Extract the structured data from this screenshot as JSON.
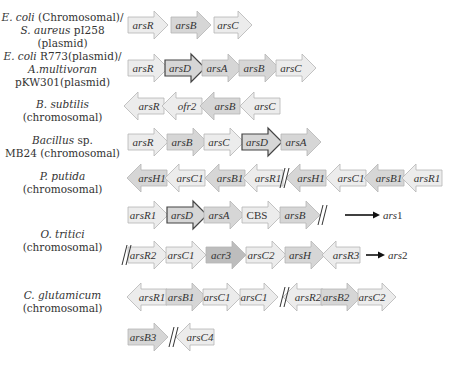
{
  "colors": {
    "light": "#ececec",
    "mid": "#d6d6d6",
    "dark": "#bdbdbd",
    "stroke_light": "#b5b5b5",
    "stroke_dark": "#444444"
  },
  "organisms": [
    {
      "id": "ecoli-saureus",
      "lines": [
        [
          "E. coli",
          "italic"
        ],
        [
          " (Chromosomal)/",
          ""
        ],
        [
          "S. aureus",
          "italic"
        ],
        [
          " pI258 (plasmid)",
          ""
        ]
      ],
      "text": "E. coli (Chromosomal)/ S. aureus pI258 (plasmid)"
    },
    {
      "id": "ecoli-r773",
      "text": "E. coli R773(plasmid)/ A.multivoran pKW301(plasmid)"
    },
    {
      "id": "bsubtilis",
      "text": "B. subtilis (chromosomal)"
    },
    {
      "id": "bacillus-mb24",
      "text": "Bacillus sp. MB24 (chromosomal)"
    },
    {
      "id": "pputida",
      "text": "P. putida (chromosomal)"
    },
    {
      "id": "otritici",
      "text": "O. tritici (chromosomal)"
    },
    {
      "id": "cglutamicum",
      "text": "C. glutamicum (chromosomal)"
    }
  ],
  "labels": {
    "l1a": "E. coli",
    "l1b": " (Chromosomal)/",
    "l1c": "S. aureus",
    "l1d": " pI258 (plasmid)",
    "l2a": "E. coli",
    "l2b": " R773(plasmid)/",
    "l2c": "A.multivoran",
    "l2d": "pKW301(plasmid)",
    "l3a": "B. subtilis",
    "l3b": "(chromosomal)",
    "l4a": "Bacillus",
    "l4b": " sp.",
    "l4c": "MB24 (chromosomal)",
    "l5a": "P. putida",
    "l5b": "(chromosomal)",
    "l6a": "O. tritici",
    "l6b": "(chromosomal)",
    "l7a": "C. glutamicum",
    "l7b": "(chromosomal)"
  },
  "gene_rows": [
    {
      "organism": "ecoli-saureus",
      "y": 25,
      "genes": [
        {
          "name": "arsR",
          "dir": "right",
          "shade": "light",
          "x": 128,
          "w": 40
        },
        {
          "name": "arsB",
          "dir": "right",
          "shade": "mid",
          "x": 171,
          "w": 40
        },
        {
          "name": "arsC",
          "dir": "right",
          "shade": "light",
          "x": 214,
          "w": 38
        }
      ]
    },
    {
      "organism": "ecoli-r773",
      "y": 68,
      "genes": [
        {
          "name": "arsR",
          "dir": "right",
          "shade": "light",
          "x": 128,
          "w": 40
        },
        {
          "name": "arsD",
          "dir": "right",
          "shade": "mid",
          "x": 165,
          "w": 40,
          "bold": true
        },
        {
          "name": "arsA",
          "dir": "right",
          "shade": "mid",
          "x": 202,
          "w": 40
        },
        {
          "name": "arsB",
          "dir": "right",
          "shade": "mid",
          "x": 239,
          "w": 40
        },
        {
          "name": "arsC",
          "dir": "right",
          "shade": "light",
          "x": 276,
          "w": 40
        }
      ]
    },
    {
      "organism": "bsubtilis",
      "y": 106,
      "genes": [
        {
          "name": "arsR",
          "dir": "left",
          "shade": "light",
          "x": 124,
          "w": 40
        },
        {
          "name": "ofr2",
          "dir": "left",
          "shade": "light",
          "x": 162,
          "w": 40
        },
        {
          "name": "arsB",
          "dir": "left",
          "shade": "mid",
          "x": 200,
          "w": 40
        },
        {
          "name": "arsC",
          "dir": "left",
          "shade": "light",
          "x": 240,
          "w": 40
        }
      ]
    },
    {
      "organism": "bacillus-mb24",
      "y": 142,
      "genes": [
        {
          "name": "arsR",
          "dir": "right",
          "shade": "light",
          "x": 128,
          "w": 40
        },
        {
          "name": "arsB",
          "dir": "right",
          "shade": "mid",
          "x": 167,
          "w": 40
        },
        {
          "name": "arsC",
          "dir": "right",
          "shade": "light",
          "x": 204,
          "w": 40
        },
        {
          "name": "arsD",
          "dir": "right",
          "shade": "mid",
          "x": 242,
          "w": 40,
          "bold": true
        },
        {
          "name": "arsA",
          "dir": "right",
          "shade": "mid",
          "x": 281,
          "w": 40
        }
      ]
    },
    {
      "organism": "pputida",
      "y": 178,
      "genes": [
        {
          "name": "arsH1",
          "dir": "left",
          "shade": "mid",
          "x": 127,
          "w": 40
        },
        {
          "name": "arsC1",
          "dir": "left",
          "shade": "light",
          "x": 165,
          "w": 40
        },
        {
          "name": "arsB1",
          "dir": "left",
          "shade": "mid",
          "x": 205,
          "w": 40
        },
        {
          "name": "arsR1",
          "dir": "left",
          "shade": "light",
          "x": 243,
          "w": 40
        },
        {
          "name": "arsH1",
          "dir": "left",
          "shade": "mid",
          "x": 286,
          "w": 40
        },
        {
          "name": "arsC1",
          "dir": "left",
          "shade": "light",
          "x": 326,
          "w": 40
        },
        {
          "name": "arsB1",
          "dir": "left",
          "shade": "mid",
          "x": 364,
          "w": 40
        },
        {
          "name": "arsR1",
          "dir": "left",
          "shade": "light",
          "x": 402,
          "w": 40
        }
      ],
      "breaks": [
        {
          "x": 280
        }
      ]
    },
    {
      "organism": "otritici",
      "y": 215,
      "genes": [
        {
          "name": "arsR1",
          "dir": "right",
          "shade": "light",
          "x": 128,
          "w": 40
        },
        {
          "name": "arsD",
          "dir": "right",
          "shade": "mid",
          "x": 167,
          "w": 40,
          "bold": true
        },
        {
          "name": "arsA",
          "dir": "right",
          "shade": "mid",
          "x": 204,
          "w": 40
        },
        {
          "name": "CBS",
          "dir": "right",
          "shade": "light",
          "x": 242,
          "w": 40,
          "upright": true
        },
        {
          "name": "arsB",
          "dir": "right",
          "shade": "mid",
          "x": 280,
          "w": 40
        }
      ],
      "breaks": [
        {
          "x": 318
        }
      ],
      "operon_label": {
        "text": "ars1",
        "arrow_x1": 345,
        "arrow_x2": 380,
        "text_x": 383
      }
    },
    {
      "organism": "otritici",
      "y": 255,
      "genes": [
        {
          "name": "arsR2",
          "dir": "right",
          "shade": "light",
          "x": 128,
          "w": 40
        },
        {
          "name": "arsC1",
          "dir": "right",
          "shade": "light",
          "x": 166,
          "w": 40
        },
        {
          "name": "acr3",
          "dir": "right",
          "shade": "dark",
          "x": 206,
          "w": 40
        },
        {
          "name": "arsC2",
          "dir": "right",
          "shade": "light",
          "x": 246,
          "w": 40
        },
        {
          "name": "arsH",
          "dir": "right",
          "shade": "mid",
          "x": 285,
          "w": 40
        },
        {
          "name": "arsR3",
          "dir": "left",
          "shade": "light",
          "x": 322,
          "w": 38
        }
      ],
      "breaks": [
        {
          "x": 122
        }
      ],
      "operon_label": {
        "text": "ars2",
        "arrow_x1": 366,
        "arrow_x2": 385,
        "text_x": 388
      }
    },
    {
      "organism": "cglutamicum",
      "y": 297,
      "genes": [
        {
          "name": "arsR1",
          "dir": "left",
          "shade": "light",
          "x": 127,
          "w": 40
        },
        {
          "name": "arsB1",
          "dir": "right",
          "shade": "mid",
          "x": 166,
          "w": 40
        },
        {
          "name": "arsC1",
          "dir": "right",
          "shade": "light",
          "x": 203,
          "w": 38
        },
        {
          "name": "arsC1",
          "dir": "right",
          "shade": "light",
          "x": 240,
          "w": 38
        },
        {
          "name": "arsR2",
          "dir": "left",
          "shade": "light",
          "x": 283,
          "w": 40
        },
        {
          "name": "arsB2",
          "dir": "right",
          "shade": "mid",
          "x": 321,
          "w": 40
        },
        {
          "name": "arsC2",
          "dir": "right",
          "shade": "light",
          "x": 358,
          "w": 38
        }
      ],
      "breaks": [
        {
          "x": 280
        }
      ]
    },
    {
      "organism": "cglutamicum",
      "y": 337,
      "genes": [
        {
          "name": "arsB3",
          "dir": "right",
          "shade": "mid",
          "x": 128,
          "w": 40
        },
        {
          "name": "arsC4",
          "dir": "left",
          "shade": "light",
          "x": 176,
          "w": 38
        }
      ],
      "breaks": [
        {
          "x": 169
        }
      ]
    }
  ]
}
